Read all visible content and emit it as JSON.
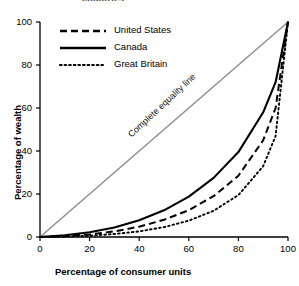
{
  "clipped_header": "countries",
  "chart_data": {
    "type": "line",
    "title": "",
    "xlabel": "Percentage of consumer units",
    "ylabel": "Percentage of wealth",
    "xlim": [
      0,
      100
    ],
    "ylim": [
      0,
      100
    ],
    "xticks": [
      "0",
      "20",
      "40",
      "60",
      "80",
      "100"
    ],
    "yticks": [
      "0",
      "20",
      "40",
      "60",
      "80",
      "100"
    ],
    "xtick_values": [
      0,
      20,
      40,
      60,
      80,
      100
    ],
    "ytick_values": [
      0,
      20,
      40,
      60,
      80,
      100
    ],
    "grid": false,
    "legend_position": "top-left",
    "x": [
      0,
      10,
      20,
      30,
      40,
      50,
      60,
      70,
      80,
      90,
      95,
      100
    ],
    "series": [
      {
        "name": "United States",
        "style": "dashed",
        "color": "#000000",
        "values": [
          0,
          0.4,
          1.2,
          2.6,
          4.8,
          8.0,
          12.5,
          19.0,
          28.5,
          45.0,
          60.0,
          100
        ]
      },
      {
        "name": "Canada",
        "style": "solid",
        "color": "#000000",
        "values": [
          0,
          0.8,
          2.2,
          4.4,
          7.8,
          12.4,
          18.8,
          27.5,
          39.5,
          58.0,
          72.0,
          100
        ]
      },
      {
        "name": "Great Britain",
        "style": "dotted",
        "color": "#000000",
        "values": [
          0,
          0.2,
          0.6,
          1.4,
          2.6,
          4.6,
          7.6,
          12.2,
          19.5,
          33.0,
          47.0,
          100
        ]
      }
    ],
    "reference_line": {
      "name": "Complete equality line",
      "label": "Complete equality line",
      "style": "solid",
      "color": "#8c8c8c",
      "from": [
        0,
        0
      ],
      "to": [
        100,
        100
      ]
    },
    "annotations": [
      {
        "text": "Complete equality line",
        "x": 28,
        "y": 34
      }
    ],
    "legend": [
      {
        "label": "United States",
        "style": "dashed"
      },
      {
        "label": "Canada",
        "style": "solid"
      },
      {
        "label": "Great Britain",
        "style": "dotted"
      }
    ]
  }
}
